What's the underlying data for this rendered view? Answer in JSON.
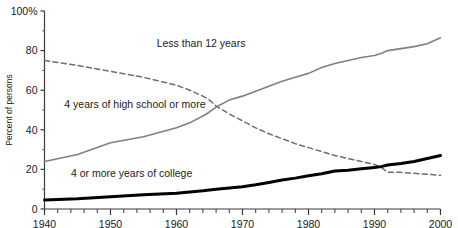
{
  "chart_data": {
    "type": "line",
    "title": "",
    "xlabel": "",
    "ylabel": "Percent of persons",
    "xlim": [
      1940,
      2000
    ],
    "ylim": [
      0,
      100
    ],
    "grid": false,
    "legend_position": "inline-annotations",
    "xticks": [
      1940,
      1950,
      1960,
      1970,
      1980,
      1990,
      2000
    ],
    "xtick_labels": [
      "1940",
      "1950",
      "1960",
      "1970",
      "1980",
      "1990",
      "2000"
    ],
    "minor_xtick_interval": 2,
    "yticks": [
      0,
      20,
      40,
      60,
      80,
      100
    ],
    "ytick_labels": [
      "0",
      "20",
      "40",
      "60",
      "80",
      "100%"
    ],
    "x": [
      1940,
      1945,
      1950,
      1955,
      1960,
      1962,
      1964,
      1965,
      1966,
      1968,
      1970,
      1972,
      1974,
      1976,
      1978,
      1980,
      1982,
      1984,
      1986,
      1988,
      1990,
      1991,
      1992,
      1993,
      1994,
      1996,
      1998,
      2000
    ],
    "series": [
      {
        "name": "Less than 12 years",
        "style": "dashed",
        "color": "#6e6e6e",
        "width": 1.5,
        "label_x": 1957,
        "label_y": 82,
        "values": [
          75.0,
          72.5,
          69.5,
          66.5,
          62.5,
          60.0,
          57.0,
          55.0,
          52.0,
          48.0,
          44.5,
          41.0,
          38.0,
          35.5,
          33.0,
          31.0,
          29.0,
          27.0,
          25.5,
          24.0,
          22.5,
          21.0,
          18.5,
          18.5,
          18.5,
          18.0,
          17.5,
          17.0
        ]
      },
      {
        "name": "4 years of high school or more",
        "style": "solid",
        "color": "#808080",
        "width": 1.6,
        "label_x": 1943,
        "label_y": 51,
        "values": [
          24.0,
          27.5,
          33.5,
          36.5,
          41.0,
          43.5,
          47.0,
          49.0,
          51.5,
          55.0,
          57.0,
          59.5,
          62.0,
          64.5,
          66.5,
          68.5,
          71.5,
          73.5,
          75.0,
          76.5,
          77.5,
          78.5,
          80.0,
          80.5,
          81.0,
          82.0,
          83.5,
          86.5
        ]
      },
      {
        "name": "4 or more years of college",
        "style": "solid",
        "color": "#000000",
        "width": 3.0,
        "label_x": 1944,
        "label_y": 16,
        "values": [
          4.6,
          5.2,
          6.2,
          7.2,
          8.0,
          8.6,
          9.2,
          9.6,
          10.0,
          10.6,
          11.2,
          12.2,
          13.4,
          14.6,
          15.6,
          16.8,
          17.8,
          19.2,
          19.6,
          20.3,
          21.0,
          21.4,
          22.2,
          22.6,
          23.0,
          24.0,
          25.5,
          27.0
        ]
      }
    ]
  }
}
